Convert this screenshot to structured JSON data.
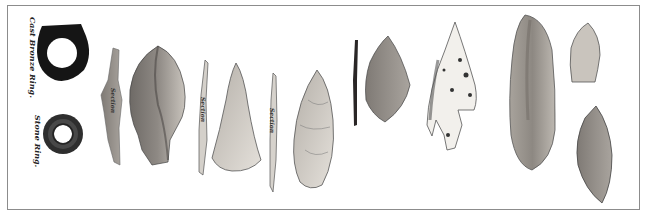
{
  "plate": {
    "frame_color": "#8c8c8c",
    "labels": {
      "cast_bronze_ring": "Cast Bronze Ring.",
      "stone_ring": "Stone Ring.",
      "section_1": "Section",
      "section_2": "Section",
      "section_3": "Section"
    },
    "artifacts": [
      {
        "id": "cast-bronze-ring",
        "type": "ring",
        "material": "bronze"
      },
      {
        "id": "stone-ring",
        "type": "ring",
        "material": "stone"
      },
      {
        "id": "blade-section-1",
        "type": "section"
      },
      {
        "id": "leaf-point-large",
        "type": "point"
      },
      {
        "id": "blade-section-2",
        "type": "section"
      },
      {
        "id": "triangular-point",
        "type": "point"
      },
      {
        "id": "blade-section-3",
        "type": "section"
      },
      {
        "id": "lanceolate-point",
        "type": "point"
      },
      {
        "id": "thin-rod",
        "type": "section"
      },
      {
        "id": "diamond-point",
        "type": "point"
      },
      {
        "id": "barbed-arrowhead",
        "type": "point"
      },
      {
        "id": "long-blade",
        "type": "point"
      },
      {
        "id": "small-stemmed-point",
        "type": "point"
      },
      {
        "id": "oval-point",
        "type": "point"
      }
    ],
    "colors": {
      "bronze": "#1a1a1a",
      "stone_dark": "#3a3a3a",
      "flint_mid": "#8a8580",
      "flint_light": "#cfcac3",
      "outline": "#555555"
    }
  }
}
